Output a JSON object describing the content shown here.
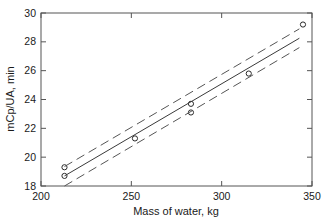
{
  "chart_data": {
    "type": "scatter",
    "title": "",
    "xlabel": "Mass of water, kg",
    "ylabel": "mCp/UA, min",
    "xlim": [
      200,
      350
    ],
    "ylim": [
      18,
      30
    ],
    "xticks": [
      200,
      250,
      300,
      350
    ],
    "yticks": [
      18,
      20,
      22,
      24,
      26,
      28,
      30
    ],
    "xtick_labels": [
      "200",
      "250",
      "300",
      "350"
    ],
    "ytick_labels": [
      "18",
      "20",
      "22",
      "24",
      "26",
      "28",
      "30"
    ],
    "grid": false,
    "legend": "none",
    "series": [
      {
        "name": "Measured data",
        "type": "scatter",
        "marker": "open-circle",
        "color": "#2a2a2a",
        "points": [
          {
            "x": 213,
            "y": 19.3
          },
          {
            "x": 213,
            "y": 18.7
          },
          {
            "x": 252,
            "y": 21.3
          },
          {
            "x": 283,
            "y": 23.7
          },
          {
            "x": 283,
            "y": 23.1
          },
          {
            "x": 315,
            "y": 25.8
          },
          {
            "x": 345,
            "y": 29.2
          }
        ]
      },
      {
        "name": "Regression fit",
        "type": "line",
        "style": "solid",
        "color": "#3a3a3a",
        "x": [
          213,
          343
        ],
        "y": [
          18.7,
          28.25
        ]
      },
      {
        "name": "Upper confidence limit",
        "type": "line",
        "style": "dashed",
        "color": "#555555",
        "x": [
          213,
          343
        ],
        "y": [
          19.35,
          28.9
        ]
      },
      {
        "name": "Lower confidence limit",
        "type": "line",
        "style": "dashed",
        "color": "#555555",
        "x": [
          213,
          343
        ],
        "y": [
          18.0,
          27.6
        ]
      }
    ]
  },
  "figure": {
    "background_color": "#ffffff",
    "axis_color": "#555555",
    "text_color": "#1a1a1a"
  }
}
